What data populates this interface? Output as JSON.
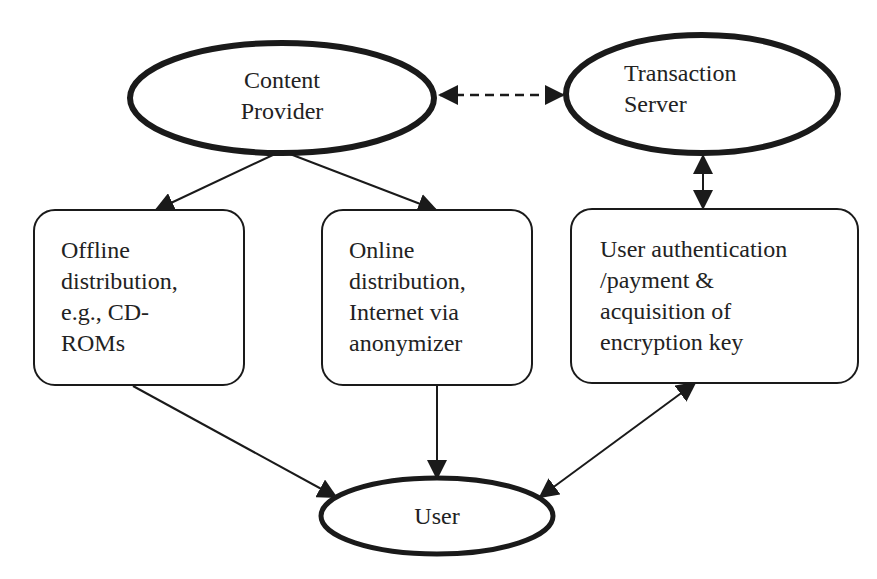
{
  "diagram": {
    "nodes": {
      "content_provider": {
        "line1": "Content",
        "line2": "Provider",
        "shape": "ellipse"
      },
      "transaction_server": {
        "line1": "Transaction",
        "line2": "Server",
        "shape": "ellipse"
      },
      "offline": {
        "lines": [
          "Offline",
          "distribution,",
          "e.g., CD-",
          "ROMs"
        ],
        "shape": "rounded-rect"
      },
      "online": {
        "lines": [
          "Online",
          "distribution,",
          "Internet via",
          "anonymizer"
        ],
        "shape": "rounded-rect"
      },
      "auth": {
        "lines": [
          "User authentication",
          "/payment &",
          "acquisition of",
          "encryption key"
        ],
        "shape": "rounded-rect"
      },
      "user": {
        "line1": "User",
        "shape": "ellipse"
      }
    },
    "edges": [
      {
        "from": "content_provider",
        "to": "transaction_server",
        "style": "dashed",
        "direction": "both"
      },
      {
        "from": "content_provider",
        "to": "offline",
        "style": "solid",
        "direction": "forward"
      },
      {
        "from": "content_provider",
        "to": "online",
        "style": "solid",
        "direction": "forward"
      },
      {
        "from": "transaction_server",
        "to": "auth",
        "style": "solid",
        "direction": "both"
      },
      {
        "from": "offline",
        "to": "user",
        "style": "solid",
        "direction": "forward"
      },
      {
        "from": "online",
        "to": "user",
        "style": "solid",
        "direction": "forward"
      },
      {
        "from": "auth",
        "to": "user",
        "style": "solid",
        "direction": "both"
      }
    ],
    "colors": {
      "stroke": "#1a1a1a",
      "background": "#ffffff",
      "text": "#222222"
    }
  }
}
